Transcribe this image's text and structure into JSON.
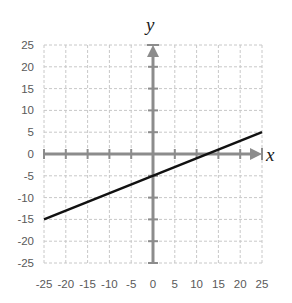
{
  "chart_data": {
    "type": "line",
    "title": "",
    "xlabel": "x",
    "ylabel": "y",
    "xlim": [
      -25,
      25
    ],
    "ylim": [
      -25,
      25
    ],
    "x_ticks": [
      -25,
      -20,
      -15,
      -10,
      -5,
      0,
      5,
      10,
      15,
      20,
      25
    ],
    "y_ticks": [
      25,
      20,
      15,
      10,
      5,
      0,
      -5,
      -10,
      -15,
      -20,
      -25
    ],
    "grid": true,
    "grid_style": "dashed",
    "legend": null,
    "series": [
      {
        "name": "y = 0.4x - 5",
        "x": [
          -25,
          25
        ],
        "y": [
          -15,
          5
        ],
        "color": "#111111"
      }
    ],
    "colors": {
      "axis": "#8c8c8c",
      "grid": "#c8c8c8",
      "line": "#111111",
      "labels": "#595959"
    }
  }
}
